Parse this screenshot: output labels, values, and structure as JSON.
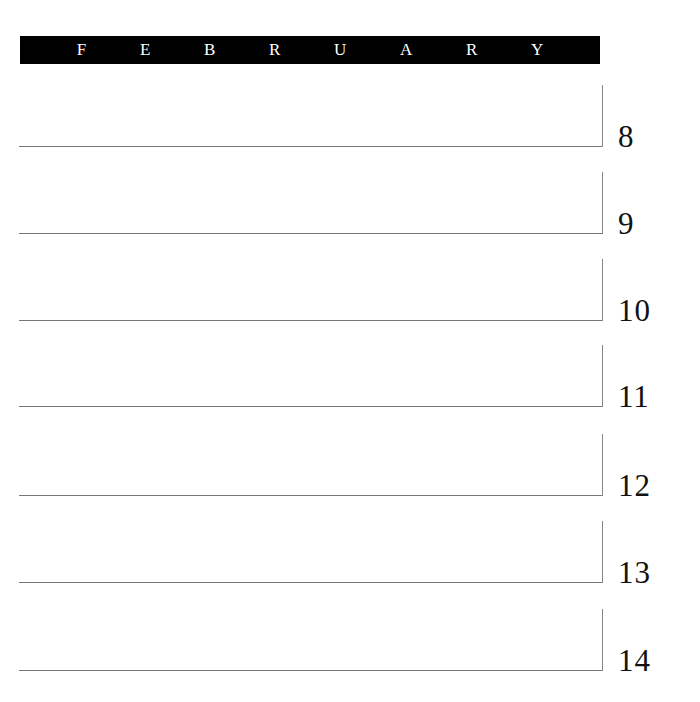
{
  "header": {
    "month_letters": [
      "F",
      "E",
      "B",
      "R",
      "U",
      "A",
      "R",
      "Y"
    ],
    "month": "FEBRUARY"
  },
  "days": [
    {
      "number": "8",
      "bottom": 146
    },
    {
      "number": "9",
      "bottom": 233
    },
    {
      "number": "10",
      "bottom": 320
    },
    {
      "number": "11",
      "bottom": 406
    },
    {
      "number": "12",
      "bottom": 495
    },
    {
      "number": "13",
      "bottom": 582
    },
    {
      "number": "14",
      "bottom": 670
    }
  ]
}
